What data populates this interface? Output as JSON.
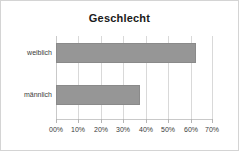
{
  "chart_data": {
    "type": "bar",
    "orientation": "horizontal",
    "title": "Geschlecht",
    "xlabel": "",
    "ylabel": "",
    "categories": [
      "weiblich",
      "männlich"
    ],
    "values": [
      62.5,
      37.5
    ],
    "value_unit": "%",
    "xlim": [
      0,
      70
    ],
    "xticks": [
      0,
      10,
      20,
      30,
      40,
      50,
      60,
      70
    ],
    "xtick_labels": [
      "00%",
      "10%",
      "20%",
      "30%",
      "40%",
      "50%",
      "60%",
      "70%"
    ],
    "grid": true,
    "grid_axis": "x",
    "legend": false,
    "series": [
      {
        "name": "Geschlecht",
        "values": [
          62.5,
          37.5
        ],
        "color": "#969696"
      }
    ],
    "colors": {
      "bar_fill": "#969696",
      "bar_border": "#8a8a8a",
      "gridline": "#d9d9d9",
      "frame_border": "#d4d4d4",
      "title_text": "#1a1a1a",
      "axis_text": "#3a3a3a",
      "background": "#ffffff"
    }
  }
}
